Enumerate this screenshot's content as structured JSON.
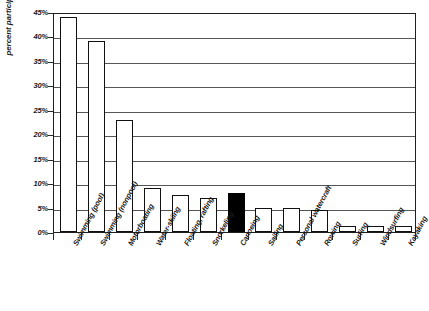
{
  "chart_data": {
    "type": "bar",
    "title": "",
    "subtitle": "",
    "xlabel": "",
    "ylabel": "percent participating",
    "ylim": [
      0,
      45
    ],
    "ytick_step": 5,
    "ytick_labels": [
      "0%",
      "5%",
      "10%",
      "15%",
      "20%",
      "25%",
      "30%",
      "35%",
      "40%",
      "45%"
    ],
    "ytick_values": [
      0,
      5,
      10,
      15,
      20,
      25,
      30,
      35,
      40,
      45
    ],
    "grid": true,
    "legend": "none",
    "categories": [
      "Swimming (pool)",
      "Swimming (nonpool)",
      "Motorboating",
      "Water-skiing",
      "Floating, rafting",
      "Snorkeling",
      "Canoeing",
      "Sailing",
      "Personal watercraft",
      "Rowing",
      "Surfing",
      "Windsurfing",
      "Kayaking"
    ],
    "values": [
      44,
      39,
      23,
      9,
      7.5,
      7,
      8,
      5,
      5,
      4.5,
      1.2,
      1.2,
      1.2
    ],
    "highlighted_category": "Canoeing",
    "highlight_color": "#000000",
    "bar_fill_color": "#ffffff",
    "bar_edge_color": "#111111",
    "gridline_color": "#555555",
    "axis_color": "#1f1f1f"
  }
}
